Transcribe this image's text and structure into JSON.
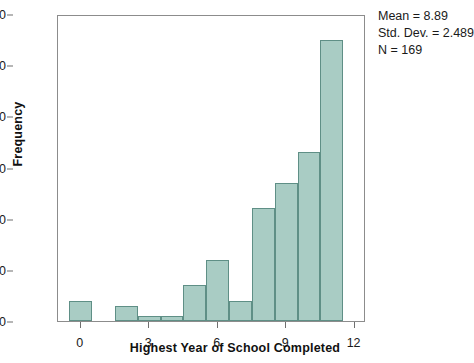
{
  "chart_data": {
    "type": "bar",
    "title": "",
    "xlabel": "Highest Year of School Completed",
    "ylabel": "Frequency",
    "categories": [
      0,
      1,
      2,
      3,
      4,
      5,
      6,
      7,
      8,
      9,
      10,
      11
    ],
    "values": [
      4,
      0,
      3,
      1,
      1,
      7,
      12,
      4,
      22,
      27,
      33,
      55
    ],
    "bin_width": 1,
    "xlim": [
      -1,
      12.5
    ],
    "ylim": [
      0,
      60
    ],
    "xticks": [
      "0",
      "3",
      "6",
      "9",
      "12"
    ],
    "xtick_values": [
      0,
      3,
      6,
      9,
      12
    ],
    "yticks": [
      "0",
      "10",
      "20",
      "30",
      "40",
      "50",
      "60"
    ],
    "ytick_values": [
      0,
      10,
      20,
      30,
      40,
      50,
      60
    ],
    "grid": false,
    "legend": "none",
    "bar_color": "#a9ccc4",
    "bar_edge_color": "#5f8f86",
    "annotations": [
      "Mean = 8.89",
      "Std. Dev. = 2.489",
      "N = 169"
    ]
  },
  "stats": {
    "mean": "Mean = 8.89",
    "std_dev": "Std. Dev. = 2.489",
    "n": "N = 169"
  },
  "axes": {
    "x_title": "Highest Year of School Completed",
    "y_title": "Frequency"
  }
}
